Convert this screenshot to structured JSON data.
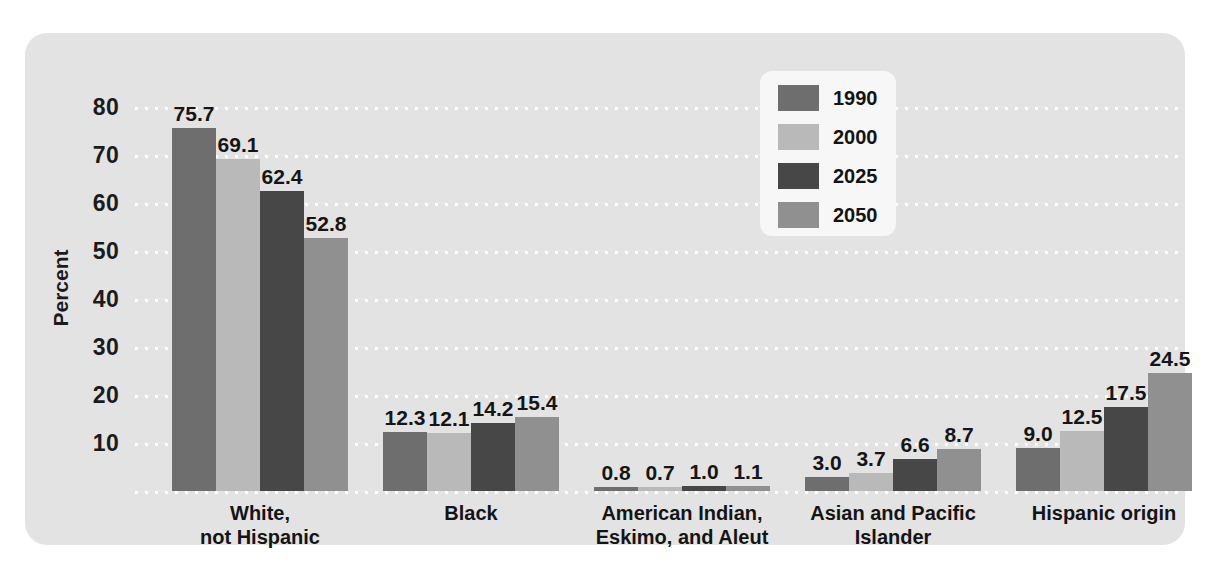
{
  "chart_data": {
    "type": "bar",
    "title": "",
    "xlabel": "",
    "ylabel": "Percent",
    "ylim": [
      0,
      80
    ],
    "yticks": [
      80,
      70,
      60,
      50,
      40,
      30,
      20,
      10
    ],
    "grid": true,
    "legend_position": "top-center-right",
    "categories": [
      "White, not Hispanic",
      "Black",
      "American Indian, Eskimo, and Aleut",
      "Asian and Pacific Islander",
      "Hispanic origin"
    ],
    "category_lines": [
      [
        "White,",
        "not Hispanic"
      ],
      [
        "Black"
      ],
      [
        "American Indian,",
        "Eskimo, and Aleut"
      ],
      [
        "Asian and Pacific",
        "Islander"
      ],
      [
        "Hispanic origin"
      ]
    ],
    "series": [
      {
        "name": "1990",
        "color": "#6e6e6e",
        "values": [
          75.7,
          12.3,
          0.8,
          3.0,
          9.0
        ],
        "labels": [
          "75.7",
          "12.3",
          "0.8",
          "3.0",
          "9.0"
        ]
      },
      {
        "name": "2000",
        "color": "#b9b9b9",
        "values": [
          69.1,
          12.1,
          0.7,
          3.7,
          12.5
        ],
        "labels": [
          "69.1",
          "12.1",
          "0.7",
          "3.7",
          "12.5"
        ]
      },
      {
        "name": "2025",
        "color": "#474747",
        "values": [
          62.4,
          14.2,
          1.0,
          6.6,
          17.5
        ],
        "labels": [
          "62.4",
          "14.2",
          "1.0",
          "6.6",
          "17.5"
        ]
      },
      {
        "name": "2050",
        "color": "#909090",
        "values": [
          52.8,
          15.4,
          1.1,
          8.7,
          24.5
        ],
        "labels": [
          "52.8",
          "15.4",
          "1.1",
          "8.7",
          "24.5"
        ]
      }
    ]
  },
  "legend": {
    "items": [
      {
        "label": "1990",
        "color": "#6e6e6e"
      },
      {
        "label": "2000",
        "color": "#b9b9b9"
      },
      {
        "label": "2025",
        "color": "#474747"
      },
      {
        "label": "2050",
        "color": "#909090"
      }
    ]
  },
  "colors": {
    "panel_background": "#e3e3e3",
    "page_background": "#ffffff",
    "gridline": "#ffffff",
    "text": "#141414",
    "legend_background": "#f7f7f7"
  }
}
